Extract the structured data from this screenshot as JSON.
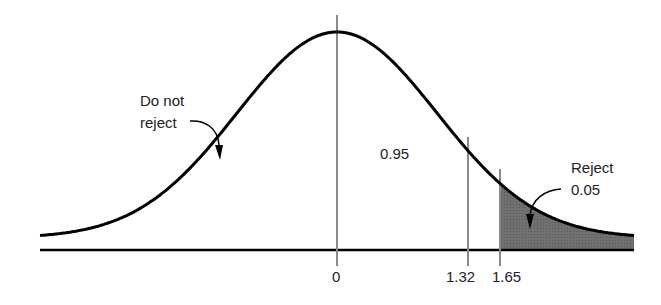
{
  "chart_data": {
    "type": "area",
    "title": "",
    "xlabel": "",
    "ylabel": "",
    "ticks": [
      "0",
      "1.32",
      "1.65"
    ],
    "regions": [
      {
        "name": "Do not reject",
        "area": 0.95
      },
      {
        "name": "Reject",
        "area": 0.05,
        "shaded": true,
        "from": 1.65
      }
    ],
    "markers": [
      {
        "x": 0,
        "label": "0"
      },
      {
        "x": 1.32,
        "label": "1.32"
      },
      {
        "x": 1.65,
        "label": "1.65"
      }
    ]
  },
  "labels": {
    "do_not_reject_line1": "Do not",
    "do_not_reject_line2": "reject",
    "area_center": "0.95",
    "reject": "Reject",
    "reject_area": "0.05",
    "tick_0": "0",
    "tick_132": "1.32",
    "tick_165": "1.65"
  },
  "colors": {
    "curve": "#000000",
    "marker_line": "#8a8a8a",
    "shade": "#6e6e6e"
  }
}
